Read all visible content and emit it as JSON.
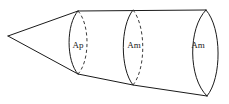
{
  "figure": {
    "type": "line-diagram",
    "background_color": "#ffffff",
    "line_color": "#1a1a1a",
    "hidden_line_color": "#3a3a3a",
    "canvas": {
      "width": 229,
      "height": 104
    },
    "apex": {
      "x": 8,
      "y": 36
    },
    "sections": [
      {
        "id": "section-ap",
        "label": "Ap",
        "label_x": 78,
        "label_y": 46,
        "center_x": 78,
        "top_y": 11,
        "bottom_y": 74,
        "front_bulge": 12,
        "back_bulge": 12,
        "back_hidden": true
      },
      {
        "id": "section-am-1",
        "label": "Am",
        "label_x": 134,
        "label_y": 46,
        "center_x": 133,
        "top_y": 10,
        "bottom_y": 85,
        "front_bulge": 13,
        "back_bulge": 13,
        "back_hidden": true
      },
      {
        "id": "section-am-2",
        "label": "Am",
        "label_x": 198,
        "label_y": 46,
        "center_x": 206,
        "top_y": 10,
        "bottom_y": 96,
        "front_bulge": 18,
        "back_bulge": 16,
        "back_hidden": false
      }
    ],
    "edges": {
      "top_cone_label": "upper cone generator",
      "bottom_cone_label": "lower cone generator",
      "top_body_label": "upper body edge",
      "bottom_body_label": "lower body edge"
    }
  }
}
